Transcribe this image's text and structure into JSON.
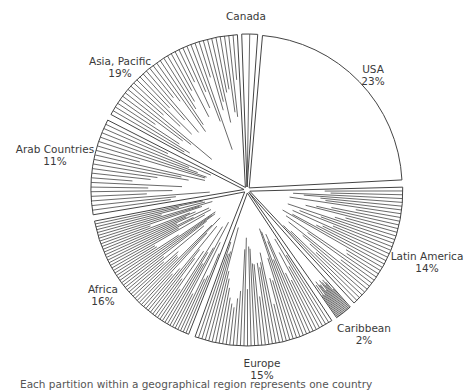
{
  "chart_data": {
    "type": "pie",
    "title": "",
    "caption": "Each partition within a geographical region represents one country",
    "center": [
      247,
      190
    ],
    "radius": 153,
    "slices": [
      {
        "label": "Canada",
        "pct": "",
        "value": 1.5,
        "start": -2,
        "end": 4,
        "partitions": 2,
        "label_pos": [
          246,
          10
        ]
      },
      {
        "label": "USA",
        "pct": "23%",
        "value": 23,
        "start": 5,
        "end": 87,
        "partitions": 1,
        "label_pos": [
          373,
          63
        ]
      },
      {
        "label": "Latin America",
        "pct": "14%",
        "value": 14,
        "start": 88.5,
        "end": 137,
        "partitions": 34,
        "label_pos": [
          427,
          250
        ]
      },
      {
        "label": "Caribbean",
        "pct": "2%",
        "value": 2,
        "start": 138.5,
        "end": 145,
        "partitions": 14,
        "label_pos": [
          364,
          322
        ]
      },
      {
        "label": "Europe",
        "pct": "15%",
        "value": 15,
        "start": 146.5,
        "end": 200,
        "partitions": 40,
        "label_pos": [
          262,
          357
        ]
      },
      {
        "label": "Africa",
        "pct": "16%",
        "value": 16,
        "start": 201.5,
        "end": 259,
        "partitions": 52,
        "label_pos": [
          103,
          283
        ]
      },
      {
        "label": "Arab Countries",
        "pct": "11%",
        "value": 11,
        "start": 260.5,
        "end": 297,
        "partitions": 21,
        "label_pos": [
          55,
          143
        ]
      },
      {
        "label": "Asia, Pacific",
        "pct": "19%",
        "value": 19,
        "start": 298.5,
        "end": 357,
        "partitions": 36,
        "label_pos": [
          120,
          55
        ]
      }
    ],
    "explode": 3
  },
  "colors": {
    "stroke": "#444444",
    "fill": "#ffffff",
    "text": "#3a3a3a"
  }
}
